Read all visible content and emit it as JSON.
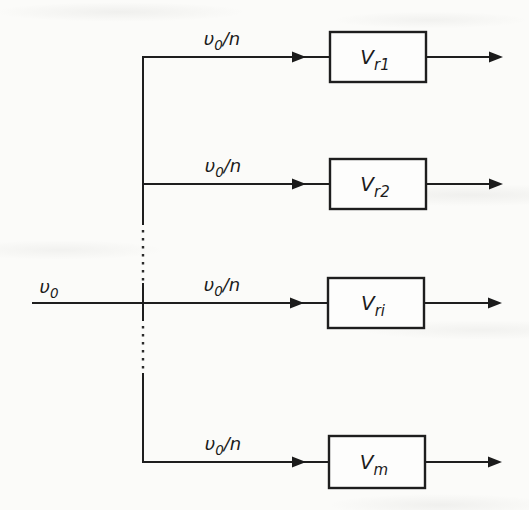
{
  "figure": {
    "type": "block-diagram",
    "description_visible_text_only": true
  },
  "colors": {
    "background": "#fbfbf9",
    "line": "#1e1e1e",
    "box_fill": "#fdfdfc",
    "text": "#1b1b1b"
  },
  "source": {
    "label": {
      "base": "υ",
      "sub": "0"
    }
  },
  "branches": [
    {
      "line_label": {
        "base": "υ",
        "sub": "0",
        "suffix": "/n"
      },
      "box_label": {
        "base": "V",
        "sub": "r1"
      }
    },
    {
      "line_label": {
        "base": "υ",
        "sub": "0",
        "suffix": "/n"
      },
      "box_label": {
        "base": "V",
        "sub": "r2"
      }
    },
    {
      "line_label": {
        "base": "υ",
        "sub": "0",
        "suffix": "/n"
      },
      "box_label": {
        "base": "V",
        "sub": "ri"
      }
    },
    {
      "line_label": {
        "base": "υ",
        "sub": "0",
        "suffix": "/n"
      },
      "box_label": {
        "base": "V",
        "sub": "m"
      }
    }
  ]
}
